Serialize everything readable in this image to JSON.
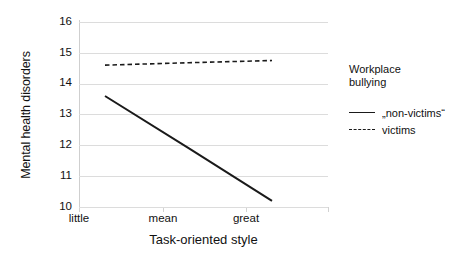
{
  "chart_data": {
    "type": "line",
    "title": "",
    "xlabel": "Task-oriented style",
    "ylabel": "Mental health disorders",
    "categories": [
      "little",
      "mean",
      "great"
    ],
    "x": [
      0,
      1,
      2
    ],
    "ylim": [
      10,
      16
    ],
    "yticks": [
      16,
      15,
      14,
      13,
      12,
      11,
      10
    ],
    "ytick_labels": [
      "16",
      "15",
      "14",
      "13",
      "12",
      "11",
      "10"
    ],
    "grid": "horizontal",
    "legend_position": "right",
    "legend_title": "Workplace bullying",
    "legend_title_lines": [
      "Workplace",
      "bullying"
    ],
    "series": [
      {
        "name": "„non-victims“",
        "style": "solid",
        "color": "#1a1a1a",
        "values": [
          13.6,
          11.9,
          10.2
        ]
      },
      {
        "name": "victims",
        "style": "dashed",
        "color": "#1a1a1a",
        "values": [
          14.6,
          14.68,
          14.75
        ]
      }
    ]
  },
  "axes": {
    "y_title": "Mental health disorders",
    "x_title": "Task-oriented style",
    "y_tick_labels": [
      "16",
      "15",
      "14",
      "13",
      "12",
      "11",
      "10"
    ],
    "x_tick_labels": [
      "little",
      "mean",
      "great"
    ]
  },
  "legend": {
    "title_line1": "Workplace",
    "title_line2": "bullying",
    "entries": [
      {
        "label": "„non-victims“",
        "style": "solid"
      },
      {
        "label": "victims",
        "style": "dashed"
      }
    ]
  },
  "colors": {
    "line": "#1a1a1a",
    "grid": "#dcdcdc",
    "axis": "#cfcfcf",
    "text": "#111111",
    "background": "#ffffff"
  }
}
